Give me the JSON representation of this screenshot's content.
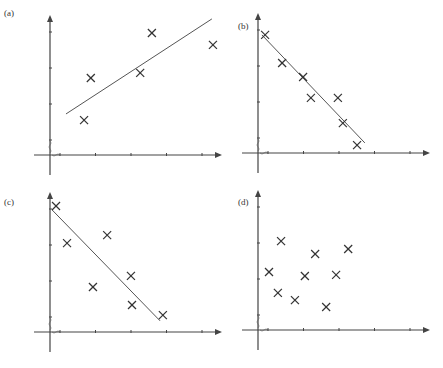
{
  "chart_data": [
    {
      "type": "scatter",
      "label": "(a)",
      "title": "",
      "xlabel": "",
      "ylabel": "",
      "xticks": 5,
      "yticks": 4,
      "grid": false,
      "points": [
        [
          0.96,
          0.97
        ],
        [
          1.15,
          2.14
        ],
        [
          2.54,
          2.28
        ],
        [
          2.87,
          3.39
        ],
        [
          4.59,
          3.06
        ]
      ],
      "fit_line": [
        [
          0.45,
          1.14
        ],
        [
          4.56,
          3.78
        ]
      ],
      "trend": "positive"
    },
    {
      "type": "scatter",
      "label": "(b)",
      "title": "",
      "xlabel": "",
      "ylabel": "",
      "xticks": 5,
      "yticks": 4,
      "grid": false,
      "points": [
        [
          0.2,
          3.28
        ],
        [
          0.68,
          2.5
        ],
        [
          1.27,
          2.11
        ],
        [
          1.49,
          1.53
        ],
        [
          2.25,
          1.53
        ],
        [
          2.39,
          0.83
        ],
        [
          2.79,
          0.22
        ]
      ],
      "fit_line": [
        [
          0.11,
          3.28
        ],
        [
          3.01,
          0.28
        ]
      ],
      "trend": "strong negative"
    },
    {
      "type": "scatter",
      "label": "(c)",
      "title": "",
      "xlabel": "",
      "ylabel": "",
      "xticks": 5,
      "yticks": 4,
      "grid": false,
      "points": [
        [
          0.17,
          3.5
        ],
        [
          0.48,
          2.47
        ],
        [
          1.21,
          1.25
        ],
        [
          1.61,
          2.69
        ],
        [
          2.28,
          1.56
        ],
        [
          2.31,
          0.75
        ],
        [
          3.18,
          0.47
        ]
      ],
      "fit_line": [
        [
          0.06,
          3.39
        ],
        [
          3.1,
          0.31
        ]
      ],
      "trend": "negative"
    },
    {
      "type": "scatter",
      "label": "(d)",
      "title": "",
      "xlabel": "",
      "ylabel": "",
      "xticks": 5,
      "yticks": 4,
      "grid": false,
      "points": [
        [
          0.31,
          1.61
        ],
        [
          0.65,
          2.47
        ],
        [
          0.56,
          1.03
        ],
        [
          1.04,
          0.83
        ],
        [
          1.32,
          1.5
        ],
        [
          1.61,
          2.11
        ],
        [
          1.92,
          0.64
        ],
        [
          2.2,
          1.53
        ],
        [
          2.54,
          2.25
        ]
      ],
      "fit_line": null,
      "trend": "none"
    }
  ],
  "layout": {
    "panels": [
      {
        "ox": 50,
        "oy": 155,
        "label_x": 2,
        "label_y": 16
      },
      {
        "ox": 258,
        "oy": 153,
        "label_x": 236,
        "label_y": 29
      },
      {
        "ox": 50,
        "oy": 332,
        "label_x": 2,
        "label_y": 205
      },
      {
        "ox": 258,
        "oy": 330,
        "label_x": 236,
        "label_y": 205
      }
    ],
    "x_unit": 35.5,
    "y_unit": 36,
    "x_axis_len": 172,
    "y_axis_top": 140,
    "colors": {
      "axis": "#444444",
      "marker": "#333333",
      "line": "#555555"
    }
  }
}
